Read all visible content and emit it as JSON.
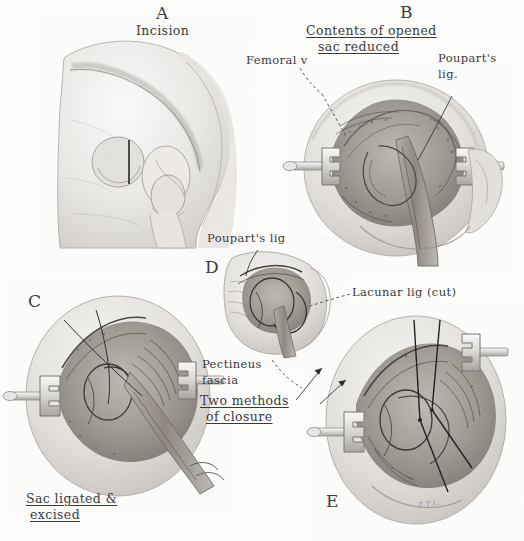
{
  "plate": {
    "title_absent": true,
    "style": "grayscale pencil and wash anatomical illustration",
    "background_color": "#fdfdfc",
    "ink_color": "#3a3a3a"
  },
  "panels": [
    {
      "id": "A",
      "letter": "A",
      "caption": "Incision",
      "caption_underlined": false
    },
    {
      "id": "B",
      "letter": "B",
      "caption_line1": "Contents of opened",
      "caption_line2": "sac reduced",
      "caption_underlined": true
    },
    {
      "id": "C",
      "letter": "C",
      "caption_line1": "Sac ligated &",
      "caption_line2": "excised",
      "caption_underlined": true
    },
    {
      "id": "D",
      "letter": "D",
      "caption": "",
      "caption_underlined": false
    },
    {
      "id": "E",
      "letter": "E",
      "caption": "",
      "caption_underlined": false
    }
  ],
  "annotations": [
    {
      "id": "femoral-vein",
      "text": "Femoral v",
      "underlined": false,
      "leader": "dashed"
    },
    {
      "id": "poupart-lig-b",
      "line1": "Poupart's",
      "line2": "lig.",
      "underlined": false,
      "leader": "solid"
    },
    {
      "id": "poupart-lig-d",
      "text": "Poupart's lig",
      "underlined": false,
      "leader": "solid"
    },
    {
      "id": "lacunar-lig",
      "text": "Lacunar lig (cut)",
      "underlined": false,
      "leader": "dashed"
    },
    {
      "id": "pectineus-fascia",
      "line1": "Pectineus",
      "line2": "fascia",
      "underlined": false,
      "leader": "dashed"
    },
    {
      "id": "two-methods",
      "line1": "Two methods",
      "line2": "of closure",
      "underlined": true,
      "leader": "arrows",
      "arrow_count": 2
    }
  ],
  "signature": {
    "text": "Z.T.L.",
    "visible": true,
    "legible": false
  }
}
